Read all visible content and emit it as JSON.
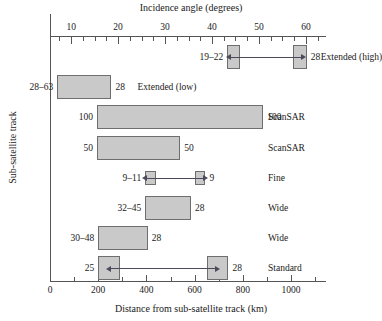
{
  "chart_data": {
    "type": "bar",
    "title": "",
    "xlabel": "Distance from sub-satellite track (km)",
    "xlabel_top": "Incidence angle (degrees)",
    "ylabel": "Sub-satellite track",
    "grid": false,
    "legend": "none",
    "orientation": "horizontal",
    "xlim": [
      0,
      1120
    ],
    "xticks": [
      0,
      200,
      400,
      600,
      800,
      1000
    ],
    "xticklabels": [
      "0",
      "200",
      "400",
      "600",
      "800",
      "1000"
    ],
    "xlim_top": [
      5.5,
      63
    ],
    "xticks_top": [
      10,
      20,
      30,
      40,
      50,
      60
    ],
    "xticklabels_top": [
      "10",
      "20",
      "30",
      "40",
      "50",
      "60"
    ],
    "bars": [
      {
        "mode": "Extended (high)",
        "left_label": "19–22",
        "right_label": "28",
        "segments": [
          [
            735,
            790
          ],
          [
            1010,
            1065
          ]
        ],
        "arrow": "double",
        "arrow_from": 790,
        "arrow_to": 1010
      },
      {
        "mode": "Extended (low)",
        "left_label": "28–63",
        "right_label": "28",
        "segments": [
          [
            30,
            255
          ]
        ],
        "arrow": "none"
      },
      {
        "mode": "ScanSAR",
        "left_label": "100",
        "right_label": "100",
        "segments": [
          [
            195,
            885
          ]
        ],
        "arrow": "none"
      },
      {
        "mode": "ScanSAR",
        "left_label": "50",
        "right_label": "50",
        "segments": [
          [
            195,
            540
          ]
        ],
        "arrow": "none"
      },
      {
        "mode": "Fine",
        "left_label": "9–11",
        "right_label": "9",
        "segments": [
          [
            395,
            440
          ],
          [
            600,
            645
          ]
        ],
        "arrow": "double",
        "arrow_from": 440,
        "arrow_to": 600
      },
      {
        "mode": "Wide",
        "left_label": "32–45",
        "right_label": "28",
        "segments": [
          [
            395,
            585
          ]
        ],
        "arrow": "none"
      },
      {
        "mode": "Wide",
        "left_label": "30–48",
        "right_label": "28",
        "segments": [
          [
            200,
            405
          ]
        ],
        "arrow": "none"
      },
      {
        "mode": "Standard",
        "left_label": "25",
        "right_label": "28",
        "segments": [
          [
            200,
            290
          ],
          [
            650,
            740
          ]
        ],
        "arrow": "double",
        "arrow_from": 290,
        "arrow_to": 650
      }
    ]
  }
}
